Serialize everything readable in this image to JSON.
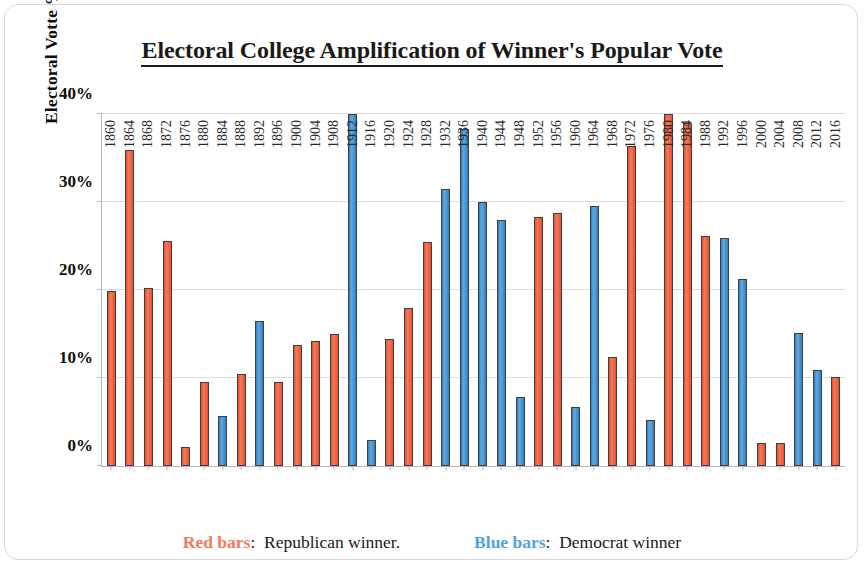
{
  "chart_data": {
    "type": "bar",
    "title": "Electoral College Amplification of Winner's Popular Vote",
    "xlabel": "",
    "ylabel": "Electoral Votte % Minus Popular Vote %",
    "ylim": [
      0,
      40
    ],
    "ytick_labels": [
      "0%",
      "10%",
      "20%",
      "30%",
      "40%"
    ],
    "ytick_values": [
      0,
      10,
      20,
      30,
      40
    ],
    "grid": true,
    "legend_position": "bottom",
    "categories": [
      "1860",
      "1864",
      "1868",
      "1872",
      "1876",
      "1880",
      "1884",
      "1888",
      "1892",
      "1896",
      "1900",
      "1904",
      "1908",
      "1912",
      "1916",
      "1920",
      "1924",
      "1928",
      "1932",
      "1936",
      "1940",
      "1944",
      "1948",
      "1952",
      "1956",
      "1960",
      "1964",
      "1968",
      "1972",
      "1976",
      "1980",
      "1984",
      "1988",
      "1992",
      "1996",
      "2000",
      "2004",
      "2008",
      "2012",
      "2016"
    ],
    "values": [
      19.9,
      35.9,
      20.2,
      25.6,
      2.2,
      9.6,
      5.7,
      10.4,
      16.5,
      9.6,
      13.7,
      14.2,
      15.0,
      40.0,
      2.9,
      14.4,
      17.9,
      25.4,
      31.5,
      38.3,
      30.0,
      28.0,
      7.8,
      28.3,
      28.7,
      6.7,
      29.5,
      12.4,
      36.4,
      5.2,
      40.0,
      39.0,
      26.1,
      25.9,
      21.3,
      2.6,
      2.6,
      15.1,
      10.9,
      10.1
    ],
    "bar_colors": [
      "rep",
      "rep",
      "rep",
      "rep",
      "rep",
      "rep",
      "dem",
      "rep",
      "dem",
      "rep",
      "rep",
      "rep",
      "rep",
      "dem",
      "dem",
      "rep",
      "rep",
      "rep",
      "dem",
      "dem",
      "dem",
      "dem",
      "dem",
      "rep",
      "rep",
      "dem",
      "dem",
      "rep",
      "rep",
      "dem",
      "rep",
      "rep",
      "rep",
      "dem",
      "dem",
      "rep",
      "rep",
      "dem",
      "dem",
      "rep"
    ],
    "colors": {
      "republican": "#e8502e",
      "democrat": "#2f7fc4",
      "legend_republican": "#f4795a",
      "legend_democrat": "#4da3e0",
      "gridline": "#dcdcdc",
      "axis": "#b7b7b7"
    },
    "legend": [
      {
        "key": "Red bars",
        "separator": ":",
        "label": "Republican winner.",
        "series": "republican"
      },
      {
        "key": "Blue bars",
        "separator": ":",
        "label": "Democrat winner",
        "series": "democrat"
      }
    ]
  }
}
